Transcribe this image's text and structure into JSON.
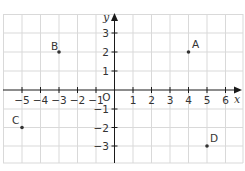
{
  "diagram": {
    "type": "coordinate-grid",
    "axes": {
      "x_label": "x",
      "y_label": "y",
      "origin_label": "O",
      "x_ticks": [
        "−5",
        "−4",
        "−3",
        "−2",
        "−1",
        "1",
        "2",
        "3",
        "4",
        "5",
        "6"
      ],
      "y_ticks": [
        "3",
        "2",
        "1",
        "−1",
        "−2",
        "−3"
      ],
      "x_range": [
        -6,
        7
      ],
      "y_range": [
        -4,
        4
      ]
    },
    "points": [
      {
        "label": "A",
        "x": 4,
        "y": 2
      },
      {
        "label": "B",
        "x": -3,
        "y": 2
      },
      {
        "label": "C",
        "x": -5,
        "y": -2
      },
      {
        "label": "D",
        "x": 5,
        "y": -3
      }
    ],
    "colors": {
      "grid": "#d9d9d9",
      "axis": "#1a1a1a",
      "point": "#333333",
      "text": "#333333"
    }
  }
}
